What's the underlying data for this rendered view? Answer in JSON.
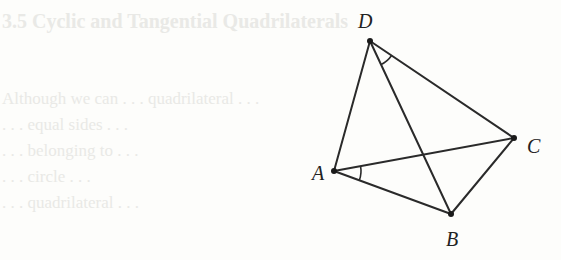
{
  "background_bleed_through": {
    "lines": [
      "3.5  Cyclic and Tangential Quadrilaterals",
      "",
      "",
      "Although we can . . . quadrilateral . . .",
      ". . . equal sides . . .",
      ". . . belonging to . . .",
      ". . . circle . . .",
      ". . . quadrilateral . . ."
    ]
  },
  "figure": {
    "points": {
      "A": {
        "x": 334,
        "y": 171,
        "label": "A",
        "lx": 312,
        "ly": 180
      },
      "B": {
        "x": 451,
        "y": 214,
        "label": "B",
        "lx": 446,
        "ly": 246
      },
      "C": {
        "x": 514,
        "y": 138,
        "label": "C",
        "lx": 527,
        "ly": 153
      },
      "D": {
        "x": 370,
        "y": 41,
        "label": "D",
        "lx": 358,
        "ly": 28
      }
    },
    "segments": [
      "DA",
      "DC",
      "DB",
      "AC",
      "AB",
      "BC"
    ],
    "angle_marks": [
      {
        "vertex": "A",
        "between": [
          "C",
          "B"
        ],
        "radius": 27
      },
      {
        "vertex": "D",
        "between": [
          "B",
          "C"
        ],
        "radius": 26
      }
    ],
    "stroke_color": "#2a2a2a",
    "point_color": "#1a1a1a"
  }
}
